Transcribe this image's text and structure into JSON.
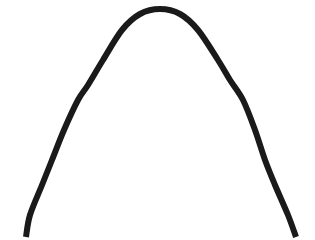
{
  "figure": {
    "background_color": "#ffffff",
    "width": 315,
    "height": 240
  },
  "chart_data": {
    "type": "line",
    "title": "",
    "subtitle": "",
    "xlabel": "",
    "ylabel": "",
    "grid": false,
    "legend_position": "none",
    "axis_visible": false,
    "tick_labels_x": [],
    "tick_labels_y": [],
    "xlim": [
      0,
      315
    ],
    "ylim": [
      240,
      0
    ],
    "series": [
      {
        "name": "arch",
        "color": "#1a1a1a",
        "stroke_width": 6,
        "points": [
          {
            "x": 26,
            "y": 237
          },
          {
            "x": 30,
            "y": 215
          },
          {
            "x": 42,
            "y": 185
          },
          {
            "x": 52,
            "y": 160
          },
          {
            "x": 64,
            "y": 130
          },
          {
            "x": 78,
            "y": 100
          },
          {
            "x": 88,
            "y": 85
          },
          {
            "x": 103,
            "y": 60
          },
          {
            "x": 122,
            "y": 30
          },
          {
            "x": 140,
            "y": 14
          },
          {
            "x": 160,
            "y": 9
          },
          {
            "x": 180,
            "y": 14
          },
          {
            "x": 198,
            "y": 30
          },
          {
            "x": 218,
            "y": 60
          },
          {
            "x": 230,
            "y": 80
          },
          {
            "x": 243,
            "y": 100
          },
          {
            "x": 255,
            "y": 130
          },
          {
            "x": 265,
            "y": 160
          },
          {
            "x": 275,
            "y": 185
          },
          {
            "x": 288,
            "y": 215
          },
          {
            "x": 296,
            "y": 237
          }
        ]
      }
    ],
    "apex": {
      "x": 160,
      "y": 9
    },
    "left_endpoint": {
      "x": 26,
      "y": 237
    },
    "right_endpoint": {
      "x": 296,
      "y": 237
    },
    "stroke_color": "#1a1a1a",
    "stroke_width": 6
  }
}
